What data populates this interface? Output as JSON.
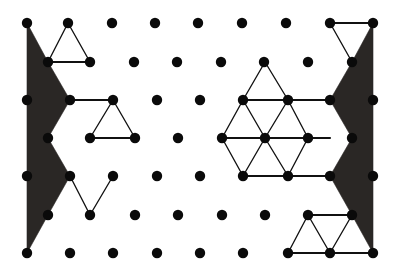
{
  "figure": {
    "type": "diagram",
    "width": 405,
    "height": 275,
    "background_color": "#ffffff",
    "dot_color": "#0a0a0a",
    "edge_color": "#111111",
    "shade_color": "#2a2725",
    "dot_radius": 5.2,
    "lattice": {
      "description": "Triangular (offset) lattice of filled round dots arranged in 7 rows",
      "rows": [
        {
          "index": 0,
          "y": 23,
          "xs": [
            27,
            68,
            112,
            155,
            198,
            242,
            286,
            330,
            373
          ]
        },
        {
          "index": 1,
          "y": 62,
          "xs": [
            48,
            90,
            134,
            177,
            221,
            264,
            308,
            352
          ]
        },
        {
          "index": 2,
          "y": 100,
          "xs": [
            27,
            70,
            113,
            157,
            200,
            243,
            288,
            330,
            373
          ]
        },
        {
          "index": 3,
          "y": 138,
          "xs": [
            48,
            90,
            135,
            178,
            222,
            265,
            308,
            352
          ]
        },
        {
          "index": 4,
          "y": 176,
          "xs": [
            27,
            70,
            113,
            157,
            200,
            243,
            288,
            330,
            373
          ]
        },
        {
          "index": 5,
          "y": 215,
          "xs": [
            48,
            90,
            135,
            178,
            222,
            265,
            308,
            352
          ]
        },
        {
          "index": 6,
          "y": 253,
          "xs": [
            27,
            70,
            113,
            157,
            200,
            243,
            288,
            330,
            373
          ]
        }
      ]
    },
    "shaded_regions": [
      {
        "name": "left-shaded-zigzag",
        "points": "27,23 48,62 70,100 48,138 70,176 48,215 27,253 27,23"
      },
      {
        "name": "right-shaded-zigzag",
        "points": "373,23 352,62 330,100 352,138 330,176 352,215 373,253 373,23"
      }
    ],
    "edges": [
      {
        "name": "top-left-triangle-a",
        "x1": 68,
        "y1": 23,
        "x2": 48,
        "y2": 62,
        "weight": "thin"
      },
      {
        "name": "top-left-triangle-b",
        "x1": 68,
        "y1": 23,
        "x2": 90,
        "y2": 62,
        "weight": "thin"
      },
      {
        "name": "top-left-triangle-c",
        "x1": 48,
        "y1": 62,
        "x2": 90,
        "y2": 62,
        "weight": "thick"
      },
      {
        "name": "mid-left-connector",
        "x1": 70,
        "y1": 100,
        "x2": 113,
        "y2": 100,
        "weight": "thick"
      },
      {
        "name": "mid-left-triangle-a",
        "x1": 113,
        "y1": 100,
        "x2": 90,
        "y2": 138,
        "weight": "thin"
      },
      {
        "name": "mid-left-triangle-b",
        "x1": 113,
        "y1": 100,
        "x2": 135,
        "y2": 138,
        "weight": "thin"
      },
      {
        "name": "mid-left-triangle-c",
        "x1": 90,
        "y1": 138,
        "x2": 135,
        "y2": 138,
        "weight": "thick"
      },
      {
        "name": "low-left-zigzag-a",
        "x1": 70,
        "y1": 176,
        "x2": 90,
        "y2": 215,
        "weight": "thin"
      },
      {
        "name": "low-left-zigzag-b",
        "x1": 90,
        "y1": 215,
        "x2": 113,
        "y2": 176,
        "weight": "thin"
      },
      {
        "name": "hex-upper-apex-left",
        "x1": 265,
        "y1": 62,
        "x2": 243,
        "y2": 100,
        "weight": "thin"
      },
      {
        "name": "hex-upper-apex-right",
        "x1": 265,
        "y1": 62,
        "x2": 288,
        "y2": 100,
        "weight": "thin"
      },
      {
        "name": "hex-row2-span",
        "x1": 243,
        "y1": 100,
        "x2": 330,
        "y2": 100,
        "weight": "thick"
      },
      {
        "name": "hex-d-a",
        "x1": 243,
        "y1": 100,
        "x2": 222,
        "y2": 138,
        "weight": "thin"
      },
      {
        "name": "hex-d-b",
        "x1": 243,
        "y1": 100,
        "x2": 265,
        "y2": 138,
        "weight": "thin"
      },
      {
        "name": "hex-d-c",
        "x1": 288,
        "y1": 100,
        "x2": 265,
        "y2": 138,
        "weight": "thin"
      },
      {
        "name": "hex-d-d",
        "x1": 288,
        "y1": 100,
        "x2": 308,
        "y2": 138,
        "weight": "thin"
      },
      {
        "name": "hex-row3-span",
        "x1": 222,
        "y1": 138,
        "x2": 330,
        "y2": 138,
        "weight": "thick"
      },
      {
        "name": "hex-d-e",
        "x1": 222,
        "y1": 138,
        "x2": 243,
        "y2": 176,
        "weight": "thin"
      },
      {
        "name": "hex-d-f",
        "x1": 265,
        "y1": 138,
        "x2": 243,
        "y2": 176,
        "weight": "thin"
      },
      {
        "name": "hex-d-g",
        "x1": 265,
        "y1": 138,
        "x2": 288,
        "y2": 176,
        "weight": "thin"
      },
      {
        "name": "hex-d-h",
        "x1": 308,
        "y1": 138,
        "x2": 288,
        "y2": 176,
        "weight": "thin"
      },
      {
        "name": "hex-row4-span",
        "x1": 243,
        "y1": 176,
        "x2": 330,
        "y2": 176,
        "weight": "thick"
      },
      {
        "name": "top-right-edge-top",
        "x1": 330,
        "y1": 23,
        "x2": 373,
        "y2": 23,
        "weight": "thick"
      },
      {
        "name": "top-right-edge-left",
        "x1": 330,
        "y1": 23,
        "x2": 352,
        "y2": 62,
        "weight": "thin"
      },
      {
        "name": "br-top-span",
        "x1": 308,
        "y1": 215,
        "x2": 352,
        "y2": 215,
        "weight": "thick"
      },
      {
        "name": "br-d-a",
        "x1": 308,
        "y1": 215,
        "x2": 288,
        "y2": 253,
        "weight": "thin"
      },
      {
        "name": "br-d-b",
        "x1": 308,
        "y1": 215,
        "x2": 330,
        "y2": 253,
        "weight": "thin"
      },
      {
        "name": "br-d-c",
        "x1": 352,
        "y1": 215,
        "x2": 330,
        "y2": 253,
        "weight": "thin"
      },
      {
        "name": "br-bottom-span",
        "x1": 288,
        "y1": 253,
        "x2": 373,
        "y2": 253,
        "weight": "thick"
      }
    ]
  }
}
